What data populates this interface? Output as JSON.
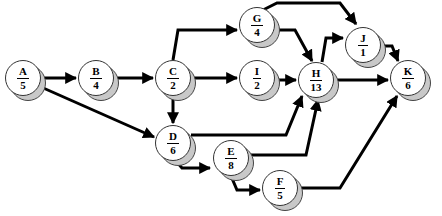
{
  "diagram": {
    "type": "network-precedence",
    "nodes": [
      {
        "id": "A",
        "duration": "5",
        "x": 23,
        "y": 78
      },
      {
        "id": "B",
        "duration": "4",
        "x": 96,
        "y": 78
      },
      {
        "id": "C",
        "duration": "2",
        "x": 173,
        "y": 78
      },
      {
        "id": "D",
        "duration": "6",
        "x": 173,
        "y": 143
      },
      {
        "id": "E",
        "duration": "8",
        "x": 231,
        "y": 158
      },
      {
        "id": "F",
        "duration": "5",
        "x": 280,
        "y": 188
      },
      {
        "id": "G",
        "duration": "4",
        "x": 257,
        "y": 25
      },
      {
        "id": "I",
        "duration": "2",
        "x": 257,
        "y": 78
      },
      {
        "id": "H",
        "duration": "13",
        "x": 316,
        "y": 80
      },
      {
        "id": "J",
        "duration": "1",
        "x": 363,
        "y": 45
      },
      {
        "id": "K",
        "duration": "6",
        "x": 408,
        "y": 78
      }
    ],
    "edges": [
      {
        "from": "A",
        "to": "B",
        "points": "41,78 76,78"
      },
      {
        "from": "A",
        "to": "D",
        "points": "41,87 154,137"
      },
      {
        "from": "B",
        "to": "C",
        "points": "114,78 153,78"
      },
      {
        "from": "C",
        "to": "G",
        "points": "173,60 178,30 237,30"
      },
      {
        "from": "C",
        "to": "I",
        "points": "191,78 237,78"
      },
      {
        "from": "C",
        "to": "D",
        "points": "173,96 173,123"
      },
      {
        "from": "G",
        "to": "J",
        "points": "263,10 277,3 340,3 356,24"
      },
      {
        "from": "G",
        "to": "H",
        "points": "275,30 295,30 312,61"
      },
      {
        "from": "I",
        "to": "H",
        "points": "275,80 296,80"
      },
      {
        "from": "H",
        "to": "J",
        "points": "322,62 326,38 343,38"
      },
      {
        "from": "H",
        "to": "K",
        "points": "334,80 388,80"
      },
      {
        "from": "J",
        "to": "K",
        "points": "381,46 392,46 398,61"
      },
      {
        "from": "D",
        "to": "H",
        "points": "191,135 286,135 302,96"
      },
      {
        "from": "D",
        "to": "E",
        "points": "176,161 182,168 210,168"
      },
      {
        "from": "E",
        "to": "H",
        "points": "249,155 306,155 318,100"
      },
      {
        "from": "E",
        "to": "F",
        "points": "231,176 237,190 260,190"
      },
      {
        "from": "F",
        "to": "K",
        "points": "298,188 340,188 397,96"
      }
    ]
  }
}
